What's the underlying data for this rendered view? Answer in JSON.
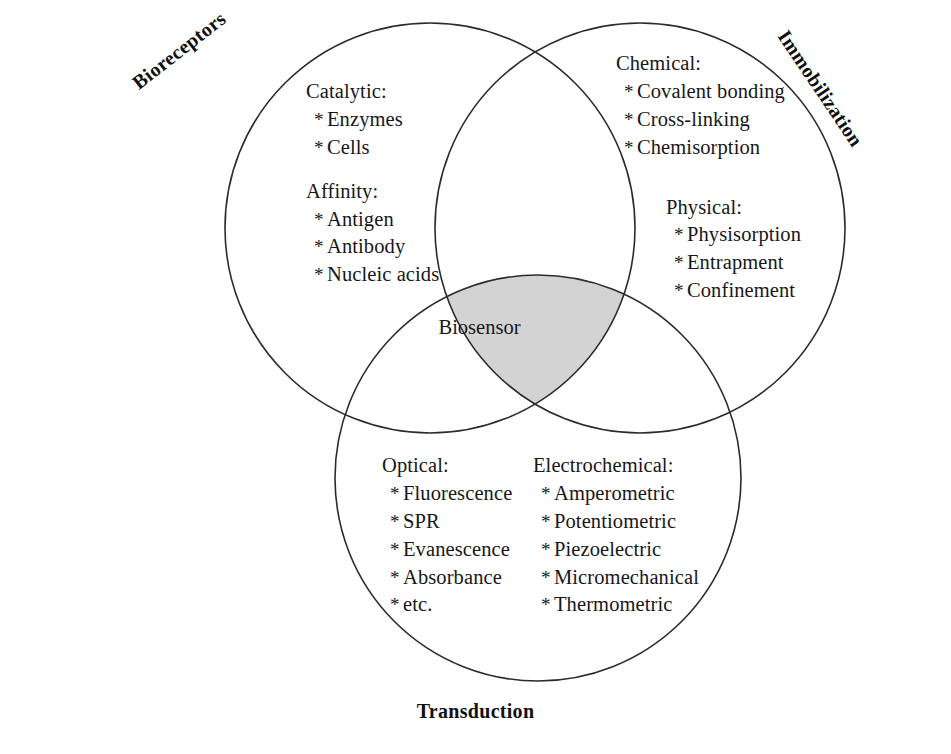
{
  "figure": {
    "type": "venn-diagram-3-set",
    "background_color": "#ffffff",
    "outline_color": "#2b2b2b",
    "intersection_fill": "#d3d3d3",
    "center_label": "Biosensor"
  },
  "sets": {
    "left": {
      "label": "Bioreceptors",
      "groups": [
        {
          "head": "Catalytic:",
          "items": [
            "Enzymes",
            "Cells"
          ]
        },
        {
          "head": "Affinity:",
          "items": [
            "Antigen",
            "Antibody",
            "Nucleic acids"
          ]
        }
      ]
    },
    "right": {
      "label": "Immobilization",
      "groups": [
        {
          "head": "Chemical:",
          "items": [
            "Covalent bonding",
            "Cross-linking",
            "Chemisorption"
          ]
        },
        {
          "head": "Physical:",
          "items": [
            "Physisorption",
            "Entrapment",
            "Confinement"
          ]
        }
      ]
    },
    "bottom": {
      "label": "Transduction",
      "groups": [
        {
          "head": "Optical:",
          "items": [
            "Fluorescence",
            "SPR",
            "Evanescence",
            "Absorbance",
            "etc."
          ]
        },
        {
          "head": "Electrochemical:",
          "items": [
            "Amperometric",
            "Potentiometric",
            "Piezoelectric",
            "Micromechanical",
            "Thermometric"
          ]
        }
      ]
    }
  },
  "bullet": "*"
}
